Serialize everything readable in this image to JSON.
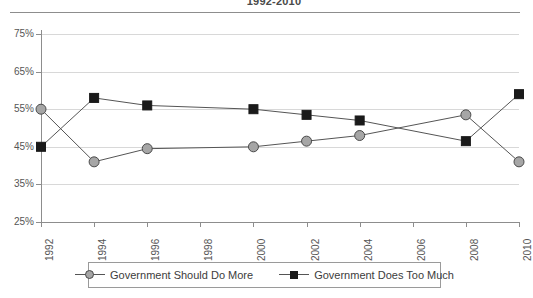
{
  "chart_data": {
    "type": "line",
    "title": "1992-2010",
    "xlabel": "",
    "ylabel": "",
    "x": [
      1992,
      1994,
      1996,
      1998,
      2000,
      2002,
      2004,
      2006,
      2008,
      2010
    ],
    "categories": [
      "1992",
      "1994",
      "1996",
      "1998",
      "2000",
      "2002",
      "2004",
      "2006",
      "2008",
      "2010"
    ],
    "series": [
      {
        "name": "Government Should Do More",
        "marker": "circle",
        "color": "#a6a6a6",
        "values": [
          55,
          41,
          44.5,
          null,
          45,
          46.5,
          48,
          null,
          53.5,
          41
        ]
      },
      {
        "name": "Government Does Too Much",
        "marker": "square",
        "color": "#1a1a1a",
        "values": [
          45,
          58,
          56,
          null,
          55,
          53.5,
          52,
          null,
          46.5,
          59
        ]
      }
    ],
    "ylim": [
      25,
      75
    ],
    "ytick_values": [
      75,
      65,
      55,
      45,
      35,
      25
    ],
    "ytick_labels": [
      "75%",
      "65%",
      "55%",
      "45%",
      "35%",
      "25%"
    ],
    "xtick_labels": [
      "1992",
      "1994",
      "1996",
      "1998",
      "2000",
      "2002",
      "2004",
      "2006",
      "2008",
      "2010"
    ],
    "grid": true,
    "legend_position": "bottom"
  },
  "legend": {
    "entries": [
      {
        "label": "Government Should Do More",
        "marker": "circle"
      },
      {
        "label": "Government Does Too Much",
        "marker": "square"
      }
    ]
  },
  "colors": {
    "circle_fill": "#a6a6a6",
    "circle_stroke": "#4a4a4a",
    "square_fill": "#1a1a1a",
    "line": "#555555",
    "grid": "#d8d8d8",
    "axis": "#8d8d8d",
    "text": "#555555"
  }
}
